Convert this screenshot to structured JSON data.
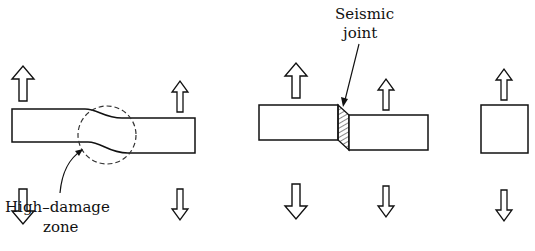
{
  "labels": {
    "high_damage_line1": "High–damage",
    "high_damage_line2": "zone",
    "seismic_line1": "Seismic",
    "seismic_line2": "joint"
  },
  "panels": [
    {
      "id": "continuous-building",
      "description": "Building with step causes high-damage zone"
    },
    {
      "id": "separated-building",
      "description": "Seismic joint separates two blocks"
    },
    {
      "id": "single-block",
      "description": "Independent block"
    }
  ],
  "colors": {
    "stroke": "#111111",
    "background": "#ffffff"
  }
}
